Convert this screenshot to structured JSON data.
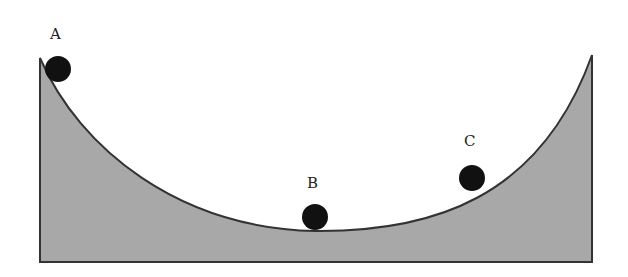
{
  "diagram": {
    "type": "valley-track",
    "colors": {
      "fill": "#a8a8a8",
      "outline": "#333333",
      "ball": "#111111",
      "background": "#ffffff"
    },
    "balls": [
      {
        "label": "A",
        "cx": 58,
        "cy": 69,
        "r": 13,
        "label_x": 50,
        "label_y": 27
      },
      {
        "label": "B",
        "cx": 315,
        "cy": 217,
        "r": 13,
        "label_x": 307,
        "label_y": 176
      },
      {
        "label": "C",
        "cx": 472,
        "cy": 178,
        "r": 13,
        "label_x": 464,
        "label_y": 134
      }
    ]
  }
}
